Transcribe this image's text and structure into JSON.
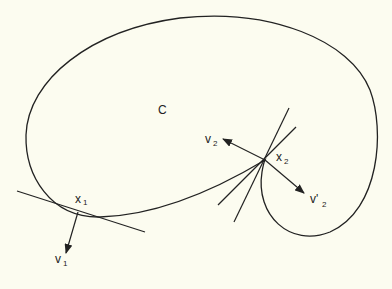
{
  "figure": {
    "curve_label": "C",
    "points": [
      {
        "id": "x1",
        "label": "x",
        "subscript": "1"
      },
      {
        "id": "x2",
        "label": "x",
        "subscript": "2"
      }
    ],
    "vectors": [
      {
        "id": "v1",
        "label": "v",
        "subscript": "1"
      },
      {
        "id": "v2",
        "label": "v",
        "subscript": "2"
      },
      {
        "id": "v2prime",
        "label": "v'",
        "subscript": "2"
      }
    ],
    "colors": {
      "background": "#fcfcf0",
      "stroke": "#222222"
    }
  }
}
